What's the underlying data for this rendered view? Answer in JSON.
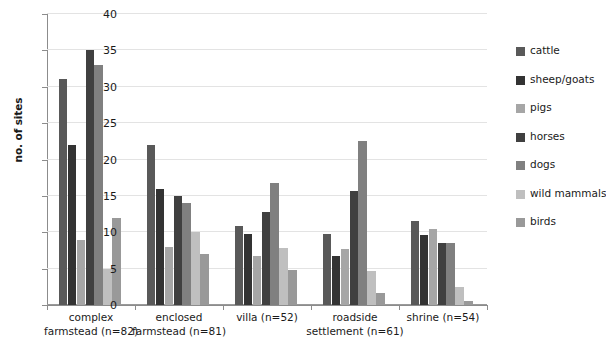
{
  "chart_data": {
    "type": "bar",
    "title": "",
    "xlabel": "",
    "ylabel": "no. of sites",
    "ylim": [
      0,
      40
    ],
    "yticks": [
      0,
      5,
      10,
      15,
      20,
      25,
      30,
      35,
      40
    ],
    "grid": true,
    "legend_position": "right",
    "categories": [
      "complex farmstead (n=82)",
      "enclosed farmstead (n=81)",
      "villa (n=52)",
      "roadside settlement (n=61)",
      "shrine (n=54)"
    ],
    "category_lines": [
      [
        "complex",
        "farmstead (n=82)"
      ],
      [
        "enclosed",
        "farmstead (n=81)"
      ],
      [
        "villa (n=52)",
        ""
      ],
      [
        "roadside",
        "settlement (n=61)"
      ],
      [
        "shrine (n=54)",
        ""
      ]
    ],
    "series": [
      {
        "name": "cattle",
        "color": "#595959",
        "values": [
          31,
          22,
          10.8,
          9.7,
          11.6
        ]
      },
      {
        "name": "sheep/goats",
        "color": "#333333",
        "values": [
          22,
          16,
          9.8,
          6.7,
          9.6
        ]
      },
      {
        "name": "pigs",
        "color": "#a6a6a6",
        "values": [
          9,
          8,
          6.8,
          7.7,
          10.5
        ]
      },
      {
        "name": "horses",
        "color": "#404040",
        "values": [
          35,
          15,
          12.8,
          15.7,
          8.5
        ]
      },
      {
        "name": "dogs",
        "color": "#808080",
        "values": [
          33,
          14,
          16.8,
          22.6,
          8.5
        ]
      },
      {
        "name": "wild mammals",
        "color": "#bfbfbf",
        "values": [
          5,
          10,
          7.8,
          4.7,
          2.5
        ]
      },
      {
        "name": "birds",
        "color": "#999999",
        "values": [
          12,
          7,
          4.8,
          1.6,
          0.5
        ]
      }
    ]
  },
  "legend": {
    "items": [
      {
        "label": "cattle",
        "color": "#595959"
      },
      {
        "label": "sheep/goats",
        "color": "#333333"
      },
      {
        "label": "pigs",
        "color": "#a6a6a6"
      },
      {
        "label": "horses",
        "color": "#404040"
      },
      {
        "label": "dogs",
        "color": "#808080"
      },
      {
        "label": "wild mammals",
        "color": "#bfbfbf"
      },
      {
        "label": "birds",
        "color": "#999999"
      }
    ]
  },
  "axis": {
    "y_title": "no. of sites"
  }
}
